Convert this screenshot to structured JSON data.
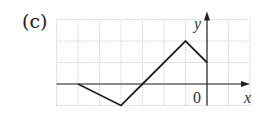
{
  "figure": {
    "label": "(c)",
    "x_axis_label": "x",
    "y_axis_label": "y",
    "origin_label": "0"
  },
  "chart_data": {
    "type": "line",
    "title": "(c)",
    "xlabel": "x",
    "ylabel": "y",
    "xlim": [
      -7,
      2
    ],
    "ylim": [
      -1,
      3
    ],
    "grid": true,
    "series": [
      {
        "name": "piecewise",
        "x": [
          -6,
          -4,
          -3,
          -1,
          0
        ],
        "y": [
          0,
          -1,
          0,
          2,
          1
        ]
      }
    ]
  }
}
